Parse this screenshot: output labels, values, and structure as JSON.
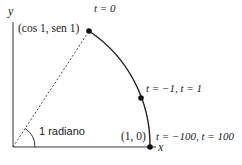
{
  "diagram": {
    "axes": {
      "x_label": "x",
      "y_label": "y"
    },
    "points": [
      {
        "id": "top",
        "coord_label": "(cos 1, sen 1)",
        "param_label": "t = 0"
      },
      {
        "id": "mid",
        "param_label": "t = −1, t = 1"
      },
      {
        "id": "base",
        "coord_label": "(1, 0)",
        "param_label": "t = −100, t = 100"
      }
    ],
    "angle_label": "1 radiano",
    "colors": {
      "stroke": "#222222",
      "point": "#111111",
      "background": "#ffffff"
    }
  }
}
